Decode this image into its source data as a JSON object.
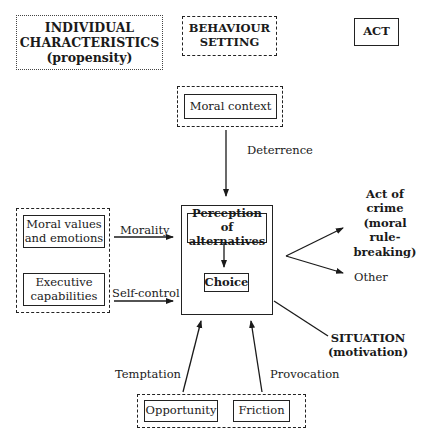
{
  "legend": {
    "individual_characteristics": {
      "line1": "INDIVIDUAL",
      "line2": "CHARACTERISTICS",
      "line3": "(propensity)",
      "border": "dotted"
    },
    "behaviour_setting": {
      "line1": "BEHAVIOUR",
      "line2": "SETTING",
      "border": "dashed"
    },
    "act": {
      "label": "ACT",
      "border": "solid"
    }
  },
  "nodes": {
    "moral_context": "Moral context",
    "moral_values": {
      "line1": "Moral values",
      "line2": "and emotions"
    },
    "executive": {
      "line1": "Executive",
      "line2": "capabilities"
    },
    "perception": {
      "line1": "Perception of",
      "line2": "alternatives"
    },
    "choice": "Choice",
    "opportunity": "Opportunity",
    "friction": "Friction",
    "act_of_crime": {
      "line1": "Act of crime",
      "line2": "(moral rule-",
      "line3": "breaking)"
    },
    "other": "Other",
    "situation": {
      "line1": "SITUATION",
      "line2": "(motivation)"
    }
  },
  "edges": {
    "deterrence": "Deterrence",
    "morality": "Morality",
    "self_control": "Self-control",
    "temptation": "Temptation",
    "provocation": "Provocation"
  }
}
